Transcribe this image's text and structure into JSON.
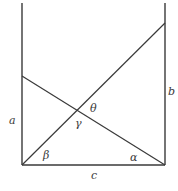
{
  "diagram": {
    "stroke_color": "#3a3a3a",
    "background": "#ffffff",
    "segments": [
      {
        "name": "left-post",
        "x1": 22,
        "y1": 3,
        "x2": 22,
        "y2": 165
      },
      {
        "name": "right-post",
        "x1": 165,
        "y1": 3,
        "x2": 165,
        "y2": 165
      },
      {
        "name": "base",
        "x1": 22,
        "y1": 165,
        "x2": 165,
        "y2": 165
      },
      {
        "name": "rising-line",
        "x1": 22,
        "y1": 165,
        "x2": 165,
        "y2": 23
      },
      {
        "name": "falling-line",
        "x1": 22,
        "y1": 76,
        "x2": 165,
        "y2": 165
      }
    ],
    "labels": {
      "a": "a",
      "b": "b",
      "c": "c",
      "alpha": "α",
      "beta": "β",
      "gamma": "γ",
      "theta": "θ"
    }
  }
}
